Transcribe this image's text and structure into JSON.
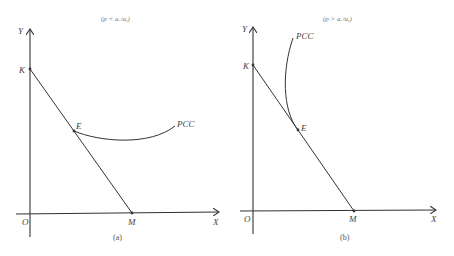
{
  "panels": [
    {
      "id": "a",
      "condition": "(p < aₓ/aᵧ)",
      "caption": "(a)",
      "axis_y_label": "Y",
      "axis_x_label": "X",
      "origin_label": "O",
      "point_k_label": "K",
      "point_e_label": "E",
      "point_m_label": "M",
      "curve_label": "PCC"
    },
    {
      "id": "b",
      "condition": "(p > aₓ/aᵧ)",
      "caption": "(b)",
      "axis_y_label": "Y",
      "axis_x_label": "X",
      "origin_label": "O",
      "point_k_label": "K",
      "point_e_label": "E",
      "point_m_label": "M",
      "curve_label": "PCC"
    }
  ],
  "colors": {
    "line": "#333333",
    "background": "#ffffff"
  }
}
